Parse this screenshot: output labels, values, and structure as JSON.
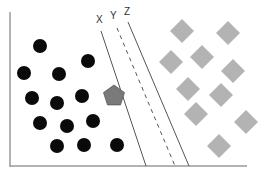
{
  "diagram": {
    "type": "svm-separating-hyperplanes",
    "colors": {
      "background": "#ffffff",
      "axis": "#9a9a9a",
      "circle": "#0a0a0a",
      "diamond": "#b3b3b3",
      "pentagon": "#7a7a7a",
      "line": "#555555",
      "label": "#333333"
    },
    "axes": {
      "left": {
        "x": 10,
        "y1": 12,
        "y2": 167
      },
      "bottom": {
        "y": 166,
        "x1": 10,
        "x2": 247
      }
    },
    "lines": [
      {
        "label": "X",
        "style": "solid",
        "x1": 101,
        "y1": 31,
        "x2": 146,
        "y2": 166,
        "label_x": 96,
        "label_y": 23
      },
      {
        "label": "Y",
        "style": "dashed",
        "x1": 117,
        "y1": 28,
        "x2": 175,
        "y2": 166,
        "label_x": 110,
        "label_y": 19
      },
      {
        "label": "Z",
        "style": "solid",
        "x1": 128,
        "y1": 22,
        "x2": 189,
        "y2": 166,
        "label_x": 124,
        "label_y": 15
      }
    ],
    "class_a": {
      "shape": "circle",
      "radius": 7,
      "points": [
        [
          40,
          46
        ],
        [
          24,
          73
        ],
        [
          59,
          74
        ],
        [
          88,
          61
        ],
        [
          32,
          98
        ],
        [
          57,
          103
        ],
        [
          82,
          96
        ],
        [
          40,
          123
        ],
        [
          67,
          126
        ],
        [
          93,
          121
        ],
        [
          57,
          146
        ],
        [
          84,
          145
        ],
        [
          117,
          145
        ]
      ]
    },
    "class_b": {
      "shape": "diamond",
      "half_size": 12,
      "points": [
        [
          182,
          31
        ],
        [
          228,
          33
        ],
        [
          171,
          62
        ],
        [
          202,
          57
        ],
        [
          233,
          71
        ],
        [
          188,
          89
        ],
        [
          221,
          95
        ],
        [
          196,
          114
        ],
        [
          246,
          122
        ],
        [
          219,
          146
        ]
      ]
    },
    "unknown_point": {
      "shape": "pentagon",
      "cx": 114,
      "cy": 96,
      "r": 11
    }
  }
}
